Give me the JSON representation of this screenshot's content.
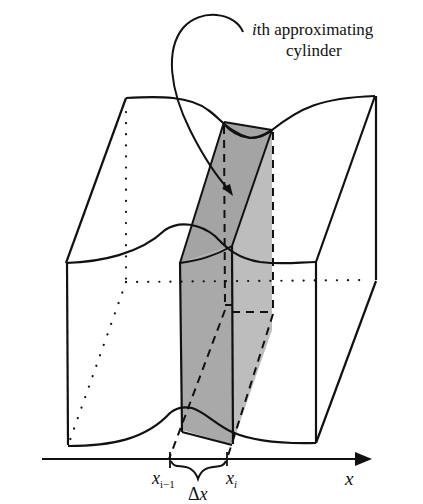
{
  "figure": {
    "caption_label_line1_italic": "i",
    "caption_label_line1_rest": "th approximating",
    "caption_label_line2": "cylinder",
    "axis": {
      "variable": "x",
      "tick_left_base": "x",
      "tick_left_sub": "i−1",
      "tick_right_base": "x",
      "tick_right_sub": "i",
      "delta_label": "Δx"
    },
    "colors": {
      "stroke": "#111111",
      "slab_fill": "#a9a9a9",
      "slab_fill_light": "#bdbdbd",
      "background": "#ffffff"
    }
  }
}
